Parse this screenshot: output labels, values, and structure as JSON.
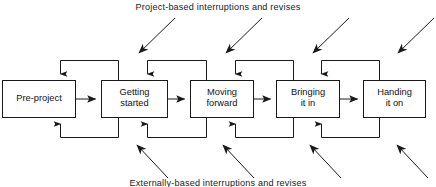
{
  "diagram": {
    "title_top": "Project-based interruptions and revises",
    "title_bottom": "Externally-based interruptions and revises",
    "stages": [
      {
        "id": "pre-project",
        "label": "Pre-project"
      },
      {
        "id": "getting-started",
        "label": "Getting\nstarted"
      },
      {
        "id": "moving-forward",
        "label": "Moving\nforward"
      },
      {
        "id": "bringing-it-in",
        "label": "Bringing\nit in"
      },
      {
        "id": "handing-it-on",
        "label": "Handing\nit on"
      }
    ],
    "flow": {
      "forward_arrow_count": 4,
      "top_feedback_loop_count": 4,
      "bottom_feedback_loop_count": 4,
      "project_based_arrow_count": 4,
      "externally_based_arrow_count": 4
    },
    "colors": {
      "line": "#1a1a1a",
      "box_fill": "#ffffff",
      "box_border": "#1a1a1a",
      "text": "#111111",
      "background": "#ffffff"
    }
  }
}
